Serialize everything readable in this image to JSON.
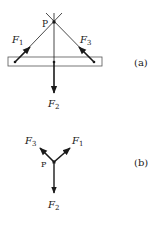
{
  "figure_a": {
    "label": "(a)",
    "point_label": "P",
    "forces": [
      {
        "name": "F",
        "sub": "1"
      },
      {
        "name": "F",
        "sub": "2"
      },
      {
        "name": "F",
        "sub": "3"
      }
    ]
  },
  "figure_b": {
    "label": "(b)",
    "point_label": "P",
    "forces": [
      {
        "name": "F",
        "sub": "1"
      },
      {
        "name": "F",
        "sub": "2"
      },
      {
        "name": "F",
        "sub": "3"
      }
    ]
  },
  "colors": {
    "line": "#1a1a1a",
    "rect_stroke": "#555555",
    "background": "#ffffff"
  }
}
